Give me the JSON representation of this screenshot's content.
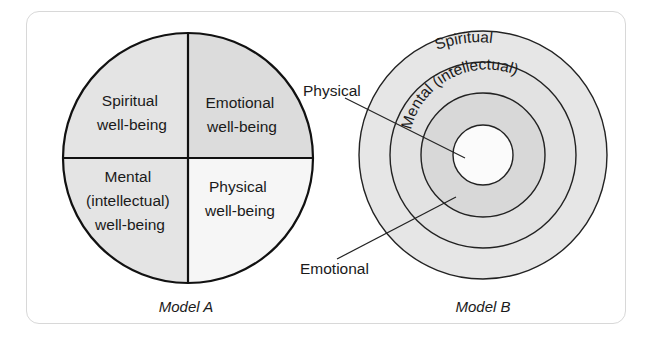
{
  "figure": {
    "model_a": {
      "caption": "Model A",
      "quadrants": [
        {
          "position": "top-left",
          "lines": [
            "Spiritual",
            "well-being"
          ],
          "fill": "#e4e4e4"
        },
        {
          "position": "top-right",
          "lines": [
            "Emotional",
            "well-being"
          ],
          "fill": "#dcdcdc"
        },
        {
          "position": "bottom-left",
          "lines": [
            "Mental",
            "(intellectual)",
            "well-being"
          ],
          "fill": "#e4e4e4"
        },
        {
          "position": "bottom-right",
          "lines": [
            "Physical",
            "well-being"
          ],
          "fill": "#f6f6f6"
        }
      ]
    },
    "model_b": {
      "caption": "Model B",
      "rings": [
        {
          "name": "Spiritual",
          "label": "Spiritual",
          "fill": "#e6e6e6"
        },
        {
          "name": "Mental",
          "label": "Mental (intellectual)",
          "fill": "#e2e2e2"
        },
        {
          "name": "Emotional",
          "label": "Emotional",
          "fill": "#d8d8d8"
        },
        {
          "name": "Physical",
          "label": "Physical",
          "fill": "#fbfbfb"
        }
      ],
      "callouts": {
        "physical": "Physical",
        "emotional": "Emotional"
      }
    }
  }
}
